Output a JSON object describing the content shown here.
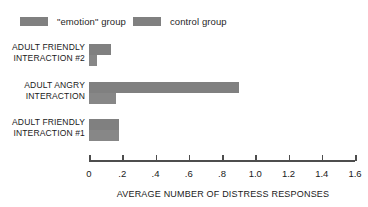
{
  "legend": {
    "items": [
      {
        "label": "\"emotion\" group",
        "color": "#808080",
        "name": "legend-emotion"
      },
      {
        "label": "control group",
        "color": "#808080",
        "name": "legend-control"
      }
    ]
  },
  "axis": {
    "title": "AVERAGE NUMBER OF DISTRESS RESPONSES",
    "ticks": [
      "0",
      ".2",
      ".4",
      ".6",
      ".8",
      "1.0",
      "1.2",
      "1.4",
      "1.6"
    ]
  },
  "categories": [
    "ADULT FRIENDLY\nINTERACTION #2",
    "ADULT ANGRY\nINTERACTION",
    "ADULT FRIENDLY\nINTERACTION #1"
  ],
  "chart_data": {
    "type": "bar",
    "orientation": "horizontal",
    "title": "",
    "xlabel": "AVERAGE NUMBER OF DISTRESS RESPONSES",
    "ylabel": "",
    "xlim": [
      0,
      1.6
    ],
    "xticks": [
      0,
      0.2,
      0.4,
      0.6,
      0.8,
      1.0,
      1.2,
      1.4,
      1.6
    ],
    "xticklabels": [
      "0",
      ".2",
      ".4",
      ".6",
      ".8",
      "1.0",
      "1.2",
      "1.4",
      "1.6"
    ],
    "grid": false,
    "legend_position": "top-left",
    "categories": [
      "ADULT FRIENDLY INTERACTION #2",
      "ADULT ANGRY INTERACTION",
      "ADULT FRIENDLY INTERACTION #1"
    ],
    "series": [
      {
        "name": "\"emotion\" group",
        "color": "#808080",
        "values": [
          0.13,
          0.9,
          0.18
        ]
      },
      {
        "name": "control group",
        "color": "#878787",
        "values": [
          0.05,
          0.16,
          0.18
        ]
      }
    ]
  }
}
